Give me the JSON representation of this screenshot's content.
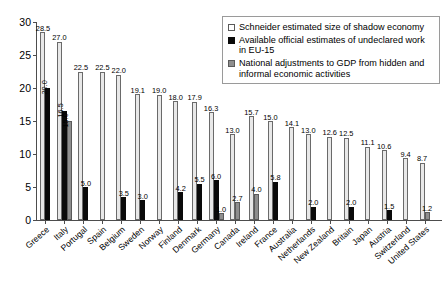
{
  "chart_data": {
    "type": "bar",
    "title": "",
    "xlabel": "",
    "ylabel": "",
    "ylim": [
      0,
      30
    ],
    "yticks": [
      0,
      5,
      10,
      15,
      20,
      25,
      30
    ],
    "grid": false,
    "legend_position": "top-right",
    "categories": [
      "Greece",
      "Italy",
      "Portugal",
      "Spain",
      "Belgium",
      "Sweden",
      "Norway",
      "Finland",
      "Denmark",
      "Germany",
      "Canada",
      "Ireland",
      "France",
      "Australia",
      "Netherlands",
      "New Zealand",
      "Britain",
      "Japan",
      "Austria",
      "Switzerland",
      "United States"
    ],
    "series": [
      {
        "name": "Schneider estimated size of shadow economy",
        "color": "#e8e8e8",
        "values": [
          28.5,
          27.0,
          22.5,
          22.5,
          22.0,
          19.1,
          19.0,
          18.0,
          17.9,
          16.3,
          13.0,
          15.7,
          15.0,
          14.1,
          13.0,
          12.6,
          12.5,
          11.1,
          10.6,
          9.4,
          8.7
        ],
        "labels": [
          "28.5",
          "27.0",
          "22.5",
          "22.5",
          "22.0",
          "19.1",
          "19.0",
          "18.0",
          "17.9",
          "16.3",
          "13.0",
          "15.7",
          "15.0",
          "14.1",
          "13.0",
          "12.6",
          "12.5",
          "11.1",
          "10.6",
          "9.4",
          "8.7"
        ]
      },
      {
        "name": "Available official estimates of undeclared work in EU-15",
        "color": "#0a0a0a",
        "values": [
          20.0,
          16.5,
          5.0,
          null,
          3.5,
          3.0,
          null,
          4.2,
          5.5,
          6.0,
          null,
          null,
          5.8,
          null,
          2.0,
          null,
          2.0,
          null,
          1.5,
          null,
          null
        ],
        "labels": [
          "20.0",
          "16.5",
          "5.0",
          "",
          "3.5",
          "3.0",
          "",
          "4.2",
          "5.5",
          "6.0",
          "",
          "",
          "5.8",
          "",
          "2.0",
          "",
          "2.0",
          "",
          "1.5",
          "",
          ""
        ]
      },
      {
        "name": "National adjustments to GDP from hidden and informal economic activities",
        "color": "#8e8e8e",
        "values": [
          null,
          15.0,
          null,
          null,
          null,
          null,
          null,
          null,
          null,
          1.0,
          2.7,
          4.0,
          null,
          null,
          null,
          null,
          null,
          null,
          null,
          null,
          1.2
        ],
        "labels": [
          "",
          "15.0",
          "",
          "",
          "",
          "",
          "",
          "",
          "",
          "1.0",
          "2.7",
          "4.0",
          "",
          "",
          "",
          "",
          "",
          "",
          "",
          "",
          "1.2"
        ]
      }
    ]
  },
  "legend": {
    "items": [
      {
        "label": "Schneider estimated size of shadow economy",
        "swatch": "s0"
      },
      {
        "label": "Available official estimates of undeclared work in EU-15",
        "swatch": "s1"
      },
      {
        "label": "National adjustments to GDP from hidden and informal economic activities",
        "swatch": "s2"
      }
    ]
  },
  "caption": ""
}
